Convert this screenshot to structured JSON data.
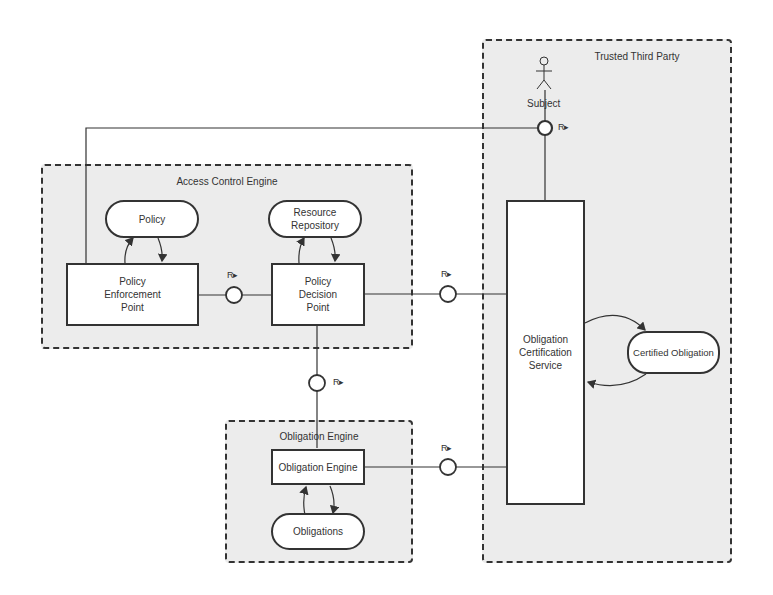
{
  "diagram": {
    "groups": {
      "trusted_third_party": "Trusted Third Party",
      "access_control_engine": "Access Control Engine",
      "obligation_engine": "Obligation Engine"
    },
    "actor": {
      "label": "Subject"
    },
    "nodes": {
      "policy": "Policy",
      "resource_repository": "Resource\nRepository",
      "pep": "Policy\nEnforcement\nPoint",
      "pdp": "Policy\nDecision\nPoint",
      "obligation_engine": "Obligation Engine",
      "obligations": "Obligations",
      "ocs": "Obligation\nCertification\nService",
      "certified_obligation": "Certified Obligation"
    },
    "interfaces": {
      "subject_r": "R▸",
      "pep_pdp_r": "R▸",
      "pdp_ocs_r": "R▸",
      "pdp_oe_r": "R▸",
      "oe_ocs_r": "R▸"
    },
    "colors": {
      "group_fill": "#ececec",
      "stroke": "#333333",
      "node_fill": "#ffffff"
    }
  }
}
